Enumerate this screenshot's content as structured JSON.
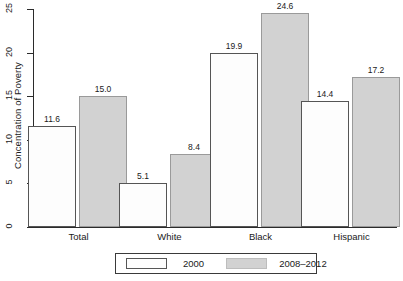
{
  "chart_data": {
    "type": "bar",
    "title": "",
    "subtitle": "",
    "xlabel": "",
    "ylabel": "Concentration of Poverty",
    "categories": [
      "Total",
      "White",
      "Black",
      "Hispanic"
    ],
    "series": [
      {
        "name": "2000",
        "values": [
          11.6,
          5.1,
          19.9,
          14.4
        ],
        "labels": [
          "11.6",
          "5.1",
          "19.9",
          "14.4"
        ],
        "fill": "#fdfdfd",
        "border": "#555555"
      },
      {
        "name": "2008–2012",
        "values": [
          15.0,
          8.4,
          24.6,
          17.2
        ],
        "labels": [
          "15.0",
          "8.4",
          "24.6",
          "17.2"
        ],
        "fill": "#d2d2d2",
        "border": "#9a9a9a"
      }
    ],
    "ylim": [
      0,
      25
    ],
    "yticks": [
      0,
      5,
      10,
      15,
      20,
      25
    ],
    "ytick_labels": [
      "0",
      "5",
      "10",
      "15",
      "20",
      "25"
    ],
    "grid": false,
    "legend_position": "bottom-center",
    "data_labels": true
  },
  "axis": {
    "y_label": "Concentration of Poverty",
    "y_ticks": [
      "0",
      "5",
      "10",
      "15",
      "20",
      "25"
    ],
    "x_categories": [
      "Total",
      "White",
      "Black",
      "Hispanic"
    ]
  },
  "legend": {
    "entries": [
      {
        "label": "2000"
      },
      {
        "label": "2008–2012"
      }
    ]
  }
}
